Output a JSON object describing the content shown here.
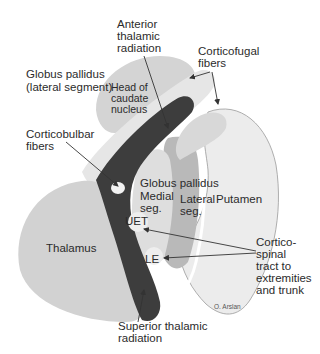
{
  "diagram": {
    "credit": "O. Arslan",
    "colors": {
      "background": "#ffffff",
      "thalamus": "#d2d2d2",
      "caudate": "#d4d4d4",
      "capsule_light": "#e6e6e6",
      "capsule_dark": "#3d3d3d",
      "gp_medial": "#dedede",
      "gp_lateral": "#b9b9b9",
      "putamen": "#ececec",
      "outline": "#9a9a9a",
      "text": "#2b2b2b",
      "arrow": "#333333"
    },
    "labels": {
      "anterior_thalamic_radiation": [
        "Anterior",
        "thalamic",
        "radiation"
      ],
      "corticofugal_fibers": [
        "Corticofugal",
        "fibers"
      ],
      "globus_pallidus_lateral_segment": [
        "Globus pallidus",
        "(lateral segment)"
      ],
      "head_of_caudate_nucleus": [
        "Head of",
        "caudate",
        "nucleus"
      ],
      "corticobulbar_fibers": [
        "Corticobulbar",
        "fibers"
      ],
      "globus_pallidus": "Globus pallidus",
      "medial_seg": [
        "Medial",
        "seg."
      ],
      "lateral_seg": [
        "Lateral",
        "seg."
      ],
      "putamen": "Putamen",
      "thalamus": "Thalamus",
      "uet": "UET",
      "le": "LE",
      "corticospinal_tract": [
        "Cortico-",
        "spinal",
        "tract to",
        "extremities",
        "and trunk"
      ],
      "superior_thalamic_radiation": [
        "Superior thalamic",
        "radiation"
      ]
    }
  }
}
